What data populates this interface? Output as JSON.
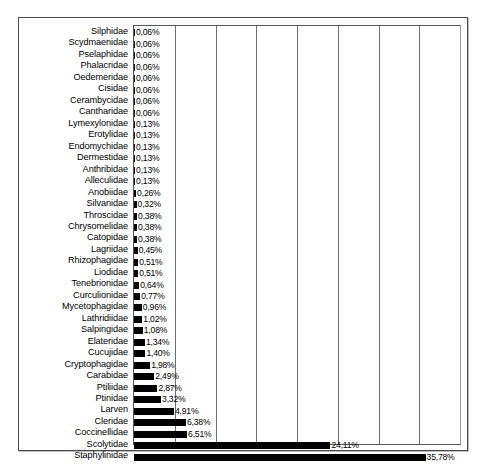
{
  "chart_data": {
    "type": "bar",
    "orientation": "horizontal",
    "title": "",
    "xlabel": "",
    "ylabel": "",
    "xlim": [
      0,
      40
    ],
    "grid": true,
    "gridline_step": 5,
    "legend": "none",
    "value_suffix": "%",
    "decimal_separator": ",",
    "categories": [
      "Silphidae",
      "Scydmaenidae",
      "Pselaphidae",
      "Phalacridae",
      "Oedemeridae",
      "Cisidae",
      "Cerambycidae",
      "Cantharidae",
      "Lymexylonidae",
      "Erotylidae",
      "Endomychidae",
      "Dermestidae",
      "Anthribidae",
      "Alleculidae",
      "Anobiidae",
      "Silvanidae",
      "Throscidae",
      "Chrysomelidae",
      "Catopidae",
      "Lagriidae",
      "Rhizophagidae",
      "Liodidae",
      "Tenebrionidae",
      "Curculionidae",
      "Mycetophagidae",
      "Lathridiidae",
      "Salpingidae",
      "Elateridae",
      "Cucujidae",
      "Cryptophagidae",
      "Carabidae",
      "Ptiliidae",
      "Ptinidae",
      "Larven",
      "Cleridae",
      "Coccinellidae",
      "Scolytidae",
      "Staphylinidae"
    ],
    "values": [
      0.06,
      0.06,
      0.06,
      0.06,
      0.06,
      0.06,
      0.06,
      0.06,
      0.13,
      0.13,
      0.13,
      0.13,
      0.13,
      0.13,
      0.26,
      0.32,
      0.38,
      0.38,
      0.38,
      0.45,
      0.51,
      0.51,
      0.64,
      0.77,
      0.96,
      1.02,
      1.08,
      1.34,
      1.4,
      1.98,
      2.49,
      2.87,
      3.32,
      4.91,
      6.38,
      6.51,
      24.11,
      35.78
    ],
    "value_labels": [
      "0,06%",
      "0,06%",
      "0,06%",
      "0,06%",
      "0,06%",
      "0,06%",
      "0,06%",
      "0,06%",
      "0,13%",
      "0,13%",
      "0,13%",
      "0,13%",
      "0,13%",
      "0,13%",
      "0,26%",
      "0,32%",
      "0,38%",
      "0,38%",
      "0,38%",
      "0,45%",
      "0,51%",
      "0,51%",
      "0,64%",
      "0,77%",
      "0,96%",
      "1,02%",
      "1,08%",
      "1,34%",
      "1,40%",
      "1,98%",
      "2,49%",
      "2,87%",
      "3,32%",
      "4,91%",
      "6,38%",
      "6,51%",
      "24,11%",
      "35,78%"
    ],
    "colors": {
      "bar": "#000000",
      "gridline": "#6f6f6f",
      "frame": "#4a4a4a",
      "background": "#ffffff",
      "text": "#000000"
    }
  }
}
